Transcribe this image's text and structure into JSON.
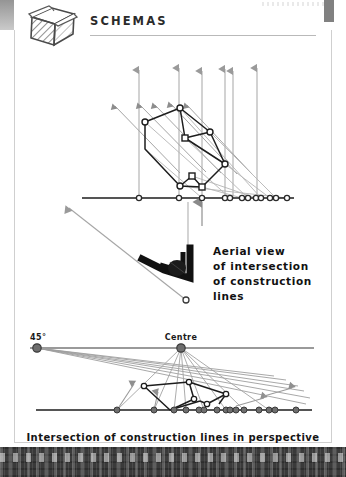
{
  "page": {
    "title": "SCHEMAS",
    "icon": "cube-icon",
    "background_color": "#ffffff",
    "frame_color": "#cfcfcf",
    "bottom_band_color": "#3a3a3a"
  },
  "callout": {
    "line1": "Aerial view",
    "line2": "of intersection",
    "line3": "of construction",
    "line4": "lines"
  },
  "caption": {
    "text": "Intersection of construction lines in perspective"
  },
  "diagrams": {
    "top": {
      "name": "aerial-plan-projection",
      "description": "Plan view of stepped rectangular building footprint with vertical and 45-degree construction rays projected onto a horizontal ground line",
      "colors": {
        "ray_gray": "#9a9a9a",
        "outline_black": "#1d1d1d",
        "baseline": "#1d1d1d",
        "node_fill": "#ffffff"
      },
      "baseline_y": 152,
      "vertical_arrow_xs": [
        125,
        165,
        188,
        211,
        219,
        243
      ],
      "diagonal_arrow_tips": [
        [
          99,
          58
        ],
        [
          124,
          57
        ],
        [
          139,
          57
        ],
        [
          155,
          56
        ],
        [
          171,
          57
        ]
      ],
      "polygon_outer": [
        [
          131,
          76
        ],
        [
          166,
          62
        ],
        [
          211,
          118
        ],
        [
          188,
          141
        ],
        [
          178,
          130
        ],
        [
          166,
          140
        ],
        [
          131,
          103
        ]
      ],
      "polygon_nodes": [
        {
          "x": 131,
          "y": 76,
          "shape": "circle"
        },
        {
          "x": 166,
          "y": 62,
          "shape": "circle"
        },
        {
          "x": 211,
          "y": 118,
          "shape": "circle"
        },
        {
          "x": 188,
          "y": 141,
          "shape": "square"
        },
        {
          "x": 178,
          "y": 130,
          "shape": "square"
        },
        {
          "x": 196,
          "y": 86,
          "shape": "circle"
        },
        {
          "x": 166,
          "y": 140,
          "shape": "circle"
        },
        {
          "x": 171,
          "y": 92,
          "shape": "square"
        }
      ],
      "baseline_nodes_x": [
        125,
        165,
        188,
        211,
        216,
        228,
        234,
        242,
        247,
        256,
        262,
        273
      ],
      "ground_arrow_x": 188,
      "left_arrow": {
        "x1": 143,
        "y1": 175,
        "x2": 66,
        "y2": 156
      }
    },
    "middle": {
      "name": "angle-marker-detail",
      "description": "Thick black angled bracket representing the intersection angle of the construction lines, with leader line to baseline",
      "angle_marker_color": "#111111",
      "leader_node": {
        "x": 172,
        "y": 104
      }
    },
    "bottom": {
      "name": "perspective-construction",
      "description": "Perspective construction with 45-degree distance point on left and centre vanishing point, rays converging to the ground line",
      "colors": {
        "ray_gray": "#8f8f8f",
        "horizon": "#7d7d7d",
        "outline_black": "#1d1d1d",
        "ground": "#1d1d1d",
        "point_fill": "#6e6e6e"
      },
      "labels": {
        "left_point": "45°",
        "centre_point": "Centre"
      },
      "horizon_y": 30,
      "ground_y": 92,
      "vanishing_point_45": {
        "x": 23,
        "y": 30
      },
      "vanishing_point_centre": {
        "x": 167,
        "y": 30
      },
      "ground_nodes_x": [
        103,
        140,
        160,
        172,
        185,
        190,
        203,
        212,
        216,
        222,
        230,
        245,
        255,
        261,
        282
      ],
      "polygon_outer": [
        [
          130,
          68
        ],
        [
          175,
          64
        ],
        [
          212,
          76
        ],
        [
          193,
          86
        ],
        [
          186,
          83
        ],
        [
          165,
          88
        ],
        [
          156,
          92
        ]
      ]
    }
  }
}
